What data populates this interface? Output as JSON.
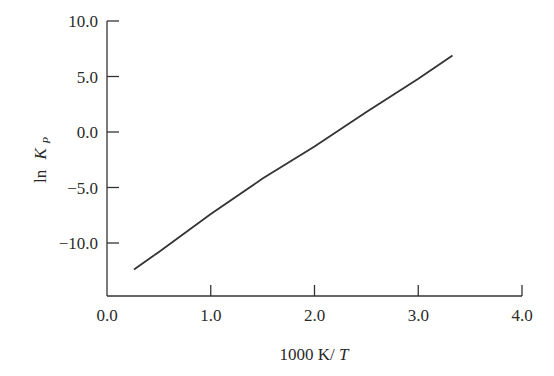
{
  "chart_data": {
    "type": "line",
    "title": "",
    "xlabel": "1000 K/T",
    "ylabel": "ln K_P",
    "xlim": [
      0.0,
      4.0
    ],
    "ylim": [
      -15.0,
      10.0
    ],
    "grid": false,
    "legend": null,
    "x_ticks": [
      "0.0",
      "1.0",
      "2.0",
      "3.0",
      "4.0"
    ],
    "y_ticks": [
      "10.0",
      "5.0",
      "0.0",
      "-5.0",
      "-10.0"
    ],
    "series": [
      {
        "name": "ln K_P",
        "x": [
          0.26,
          0.5,
          1.0,
          1.5,
          2.0,
          2.5,
          3.0,
          3.33
        ],
        "y": [
          -12.4,
          -10.8,
          -7.4,
          -4.2,
          -1.3,
          1.8,
          4.8,
          6.9
        ]
      }
    ]
  },
  "labels": {
    "y_ln": "ln",
    "y_K": "K",
    "y_sub": "P",
    "x_main": "1000 K/",
    "x_T": "T"
  }
}
